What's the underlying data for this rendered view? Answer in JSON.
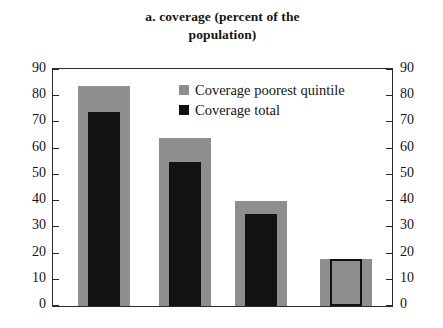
{
  "chart_data": {
    "type": "bar",
    "title": "a. coverage (percent of the population)",
    "title_line1": "a. coverage (percent of the",
    "title_line2": "population)",
    "xlabel": "",
    "ylabel": "",
    "ylim": [
      0,
      90
    ],
    "ytick_step": 10,
    "grid": false,
    "legend_position": "top-right-inside",
    "dual_axis": true,
    "categories": [
      "1",
      "2",
      "3",
      "4"
    ],
    "yticks": [
      0,
      10,
      20,
      30,
      40,
      50,
      60,
      70,
      80,
      90
    ],
    "ytick_labels_left": [
      "90",
      "80",
      "70",
      "60",
      "50",
      "40",
      "30",
      "20",
      "10",
      "0"
    ],
    "ytick_labels_right": [
      "90",
      "80",
      "70",
      "60",
      "50",
      "40",
      "30",
      "20",
      "10",
      "0"
    ],
    "series": [
      {
        "name": "Coverage poorest quintile",
        "color": "#8e8e8e",
        "values": [
          84,
          64,
          40,
          18
        ]
      },
      {
        "name": "Coverage total",
        "color": "#121212",
        "values": [
          74,
          55,
          35,
          18
        ]
      }
    ]
  },
  "legend": {
    "items": [
      {
        "label": "Coverage poorest quintile",
        "color": "#8e8e8e",
        "style": "filled"
      },
      {
        "label": "Coverage total",
        "color": "#121212",
        "style": "filled"
      }
    ]
  },
  "colors": {
    "quintile": "#8e8e8e",
    "total": "#121212",
    "axis": "#2b2b2b",
    "background": "#ffffff",
    "text": "#141414"
  }
}
